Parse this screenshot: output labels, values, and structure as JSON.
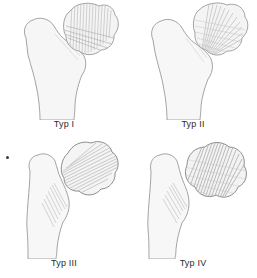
{
  "figure": {
    "background_color": "#ffffff",
    "bone_outline_color": "#9a9a9a",
    "bone_fill_color": "#f6f6f6",
    "hatch_line_color": "#b5b5b5",
    "caption_color": "#2b2b2b",
    "columns": 2,
    "rows": 2,
    "panel_count": 4
  },
  "panels": [
    {
      "id": "typ-1",
      "caption": "Typ I",
      "description": "Proximal femur, intact contour with fine vertical trabecular hatching across femoral head and neck",
      "head_displaced": false,
      "hatch_style": "vertical-fine"
    },
    {
      "id": "typ-2",
      "caption": "Typ II",
      "description": "Proximal femur with fan-shaped oblique hatching radiating from neck into head",
      "head_displaced": false,
      "hatch_style": "fan-oblique"
    },
    {
      "id": "typ-3",
      "caption": "Typ III",
      "description": "Femoral head separated from neck, head tilted with dense diagonal hatching, gap at fracture site",
      "head_displaced": true,
      "hatch_style": "diagonal-dense"
    },
    {
      "id": "typ-4",
      "caption": "Typ IV",
      "description": "Femoral head fully displaced and rotated with heavy dense hatching, wide fracture gap",
      "head_displaced": true,
      "hatch_style": "diagonal-heavy"
    }
  ],
  "marks": {
    "edge_dot": "•"
  }
}
